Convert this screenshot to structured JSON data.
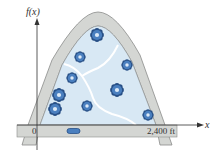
{
  "diagram": {
    "y_axis_label": "f(x)",
    "x_axis_label": "x",
    "origin_label": "0",
    "distance_label": "2,400 ft",
    "colors": {
      "road": "#d4d6d3",
      "road_edge": "#8a8c8a",
      "park_fill": "#d8e8f4",
      "path": "#ffffff",
      "tree": "#4a7fbf",
      "tree_dark": "#274f86",
      "axis": "#333333"
    },
    "trees": [
      {
        "x": 97,
        "y": 35,
        "r": 6
      },
      {
        "x": 80,
        "y": 57,
        "r": 5
      },
      {
        "x": 127,
        "y": 65,
        "r": 5
      },
      {
        "x": 72,
        "y": 78,
        "r": 5
      },
      {
        "x": 117,
        "y": 90,
        "r": 6
      },
      {
        "x": 59,
        "y": 95,
        "r": 6
      },
      {
        "x": 87,
        "y": 106,
        "r": 5
      },
      {
        "x": 55,
        "y": 109,
        "r": 6
      },
      {
        "x": 148,
        "y": 115,
        "r": 5
      }
    ]
  }
}
